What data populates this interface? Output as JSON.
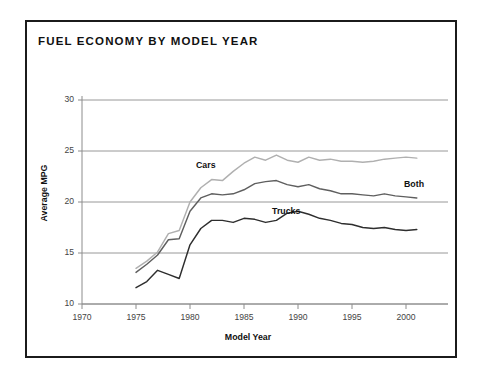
{
  "figure": {
    "title": "FUEL ECONOMY BY MODEL YEAR",
    "border_color": "#1b1b1b",
    "background": "#ffffff"
  },
  "chart_data": {
    "type": "line",
    "title": "FUEL ECONOMY BY MODEL YEAR",
    "xlabel": "Model Year",
    "ylabel": "Average MPG",
    "xlim": [
      1970,
      2002
    ],
    "ylim": [
      10,
      31
    ],
    "xticks": [
      1970,
      1975,
      1980,
      1985,
      1990,
      1995,
      2000
    ],
    "yticks": [
      10,
      15,
      20,
      25,
      30
    ],
    "grid": "horizontal",
    "legend_position": "inline-labels",
    "series": [
      {
        "name": "Cars",
        "color": "#b0b0b0",
        "label_position": {
          "x": 196,
          "y": 160
        },
        "x": [
          1975,
          1976,
          1977,
          1978,
          1979,
          1980,
          1981,
          1982,
          1983,
          1984,
          1985,
          1986,
          1987,
          1988,
          1989,
          1990,
          1991,
          1992,
          1993,
          1994,
          1995,
          1996,
          1997,
          1998,
          1999,
          2000,
          2001
        ],
        "values": [
          13.5,
          14.2,
          15.1,
          16.9,
          17.2,
          20.0,
          21.4,
          22.2,
          22.1,
          23.0,
          23.8,
          24.4,
          24.1,
          24.6,
          24.1,
          23.9,
          24.4,
          24.1,
          24.2,
          24.0,
          24.0,
          23.9,
          24.0,
          24.2,
          24.3,
          24.4,
          24.3
        ]
      },
      {
        "name": "Both",
        "color": "#5f5f5f",
        "label_position": {
          "x": 404,
          "y": 179
        },
        "x": [
          1975,
          1976,
          1977,
          1978,
          1979,
          1980,
          1981,
          1982,
          1983,
          1984,
          1985,
          1986,
          1987,
          1988,
          1989,
          1990,
          1991,
          1992,
          1993,
          1994,
          1995,
          1996,
          1997,
          1998,
          1999,
          2000,
          2001
        ],
        "values": [
          13.1,
          13.9,
          14.8,
          16.3,
          16.4,
          19.1,
          20.4,
          20.8,
          20.7,
          20.8,
          21.2,
          21.8,
          22.0,
          22.1,
          21.7,
          21.5,
          21.7,
          21.3,
          21.1,
          20.8,
          20.8,
          20.7,
          20.6,
          20.8,
          20.6,
          20.5,
          20.4
        ]
      },
      {
        "name": "Trucks",
        "color": "#2e2e2e",
        "label_position": {
          "x": 272,
          "y": 206
        },
        "x": [
          1975,
          1976,
          1977,
          1978,
          1979,
          1980,
          1981,
          1982,
          1983,
          1984,
          1985,
          1986,
          1987,
          1988,
          1989,
          1990,
          1991,
          1992,
          1993,
          1994,
          1995,
          1996,
          1997,
          1998,
          1999,
          2000,
          2001
        ],
        "values": [
          11.6,
          12.2,
          13.3,
          12.9,
          12.5,
          15.8,
          17.4,
          18.2,
          18.2,
          18.0,
          18.4,
          18.3,
          18.0,
          18.2,
          18.9,
          19.1,
          18.8,
          18.4,
          18.2,
          17.9,
          17.8,
          17.5,
          17.4,
          17.5,
          17.3,
          17.2,
          17.3
        ]
      }
    ]
  },
  "axes": {
    "yticks": [
      "30",
      "25",
      "20",
      "15",
      "10"
    ],
    "xticks": [
      "1970",
      "1975",
      "1980",
      "1985",
      "1990",
      "1995",
      "2000"
    ],
    "xlabel": "Model Year",
    "ylabel": "Average MPG"
  },
  "labels": {
    "cars": "Cars",
    "both": "Both",
    "trucks": "Trucks"
  }
}
